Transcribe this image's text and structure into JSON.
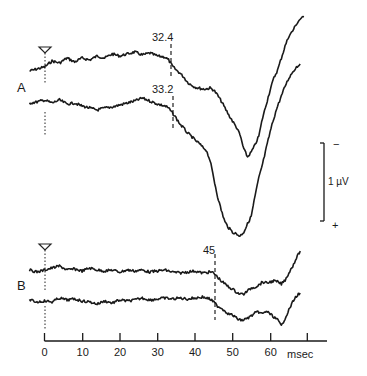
{
  "chart_data": {
    "type": "line",
    "title": "",
    "xlabel": "msec",
    "ylabel": "",
    "xlim": [
      0,
      68
    ],
    "x_ticks": [
      0,
      10,
      20,
      30,
      40,
      50,
      60
    ],
    "x_tick_labels": [
      "0",
      "10",
      "20",
      "30",
      "40",
      "50",
      "60"
    ],
    "scale_bar": {
      "label": "1 µV",
      "top_sign": "−",
      "bottom_sign": "+"
    },
    "stimulus_marker_ms": 0,
    "panels": [
      {
        "label": "A",
        "series": [
          {
            "name": "A upper trace",
            "onset_label": "32.4",
            "onset_ms": 32.4,
            "points": [
              [
                -4,
                71
              ],
              [
                -2,
                69
              ],
              [
                0,
                67
              ],
              [
                2,
                61
              ],
              [
                4,
                63
              ],
              [
                6,
                58
              ],
              [
                8,
                62
              ],
              [
                10,
                58
              ],
              [
                12,
                60
              ],
              [
                14,
                56
              ],
              [
                16,
                58
              ],
              [
                18,
                54
              ],
              [
                20,
                56
              ],
              [
                22,
                54
              ],
              [
                24,
                52
              ],
              [
                26,
                55
              ],
              [
                28,
                53
              ],
              [
                30,
                56
              ],
              [
                32,
                57
              ],
              [
                33,
                60
              ],
              [
                34,
                66
              ],
              [
                35,
                70
              ],
              [
                36,
                73
              ],
              [
                37,
                77
              ],
              [
                38,
                82
              ],
              [
                39,
                85
              ],
              [
                40,
                87
              ],
              [
                42,
                89
              ],
              [
                43,
                89
              ],
              [
                44,
                88
              ],
              [
                45,
                90
              ],
              [
                46,
                95
              ],
              [
                47,
                101
              ],
              [
                48,
                108
              ],
              [
                49,
                115
              ],
              [
                50,
                121
              ],
              [
                51,
                127
              ],
              [
                52,
                135
              ],
              [
                53,
                149
              ],
              [
                54,
                157
              ],
              [
                55,
                152
              ],
              [
                56,
                145
              ],
              [
                57,
                136
              ],
              [
                58,
                118
              ],
              [
                59,
                104
              ],
              [
                60,
                90
              ],
              [
                61,
                78
              ],
              [
                62,
                70
              ],
              [
                63,
                58
              ],
              [
                64,
                46
              ],
              [
                65,
                36
              ],
              [
                66,
                31
              ],
              [
                67,
                24
              ],
              [
                68,
                19
              ],
              [
                69,
                17
              ]
            ]
          },
          {
            "name": "A lower trace",
            "onset_label": "33.2",
            "onset_ms": 33.2,
            "points": [
              [
                -4,
                103
              ],
              [
                -2,
                102
              ],
              [
                0,
                100
              ],
              [
                2,
                103
              ],
              [
                4,
                100
              ],
              [
                6,
                104
              ],
              [
                8,
                103
              ],
              [
                10,
                106
              ],
              [
                12,
                108
              ],
              [
                14,
                110
              ],
              [
                16,
                108
              ],
              [
                18,
                107
              ],
              [
                20,
                105
              ],
              [
                22,
                103
              ],
              [
                24,
                101
              ],
              [
                26,
                98
              ],
              [
                28,
                101
              ],
              [
                30,
                104
              ],
              [
                32,
                106
              ],
              [
                33,
                108
              ],
              [
                34,
                113
              ],
              [
                35,
                118
              ],
              [
                36,
                124
              ],
              [
                37,
                128
              ],
              [
                38,
                133
              ],
              [
                39,
                136
              ],
              [
                40,
                140
              ],
              [
                41,
                143
              ],
              [
                42,
                147
              ],
              [
                43,
                150
              ],
              [
                44,
                160
              ],
              [
                45,
                178
              ],
              [
                46,
                196
              ],
              [
                47,
                210
              ],
              [
                48,
                222
              ],
              [
                49,
                228
              ],
              [
                50,
                232
              ],
              [
                51,
                234
              ],
              [
                52,
                236
              ],
              [
                53,
                232
              ],
              [
                54,
                224
              ],
              [
                55,
                216
              ],
              [
                56,
                196
              ],
              [
                57,
                178
              ],
              [
                58,
                164
              ],
              [
                59,
                148
              ],
              [
                60,
                132
              ],
              [
                61,
                118
              ],
              [
                62,
                106
              ],
              [
                63,
                96
              ],
              [
                64,
                86
              ],
              [
                65,
                78
              ],
              [
                66,
                72
              ],
              [
                67,
                67
              ],
              [
                68,
                64
              ]
            ]
          }
        ]
      },
      {
        "label": "B",
        "series": [
          {
            "name": "B upper trace",
            "onset_label": "45",
            "onset_ms": 45,
            "points": [
              [
                -4,
                270
              ],
              [
                -2,
                272
              ],
              [
                0,
                270
              ],
              [
                2,
                268
              ],
              [
                4,
                266
              ],
              [
                6,
                270
              ],
              [
                8,
                269
              ],
              [
                10,
                271
              ],
              [
                12,
                268
              ],
              [
                14,
                270
              ],
              [
                16,
                271
              ],
              [
                18,
                270
              ],
              [
                20,
                272
              ],
              [
                22,
                270
              ],
              [
                24,
                271
              ],
              [
                26,
                270
              ],
              [
                28,
                272
              ],
              [
                30,
                271
              ],
              [
                32,
                270
              ],
              [
                34,
                272
              ],
              [
                36,
                273
              ],
              [
                38,
                272
              ],
              [
                40,
                271
              ],
              [
                42,
                273
              ],
              [
                44,
                272
              ],
              [
                45,
                273
              ],
              [
                46,
                277
              ],
              [
                47,
                281
              ],
              [
                48,
                284
              ],
              [
                49,
                287
              ],
              [
                50,
                289
              ],
              [
                51,
                292
              ],
              [
                52,
                294
              ],
              [
                53,
                294
              ],
              [
                54,
                291
              ],
              [
                55,
                288
              ],
              [
                56,
                287
              ],
              [
                57,
                285
              ],
              [
                58,
                282
              ],
              [
                59,
                283
              ],
              [
                60,
                282
              ],
              [
                61,
                281
              ],
              [
                62,
                282
              ],
              [
                63,
                284
              ],
              [
                64,
                280
              ],
              [
                65,
                273
              ],
              [
                66,
                266
              ],
              [
                67,
                258
              ],
              [
                68,
                251
              ]
            ]
          },
          {
            "name": "B lower trace",
            "points": [
              [
                -4,
                300
              ],
              [
                -2,
                302
              ],
              [
                0,
                301
              ],
              [
                2,
                302
              ],
              [
                4,
                298
              ],
              [
                6,
                300
              ],
              [
                8,
                299
              ],
              [
                10,
                301
              ],
              [
                12,
                302
              ],
              [
                14,
                304
              ],
              [
                16,
                301
              ],
              [
                18,
                303
              ],
              [
                20,
                300
              ],
              [
                22,
                301
              ],
              [
                24,
                300
              ],
              [
                26,
                298
              ],
              [
                28,
                300
              ],
              [
                30,
                299
              ],
              [
                32,
                298
              ],
              [
                34,
                299
              ],
              [
                36,
                298
              ],
              [
                38,
                299
              ],
              [
                40,
                298
              ],
              [
                42,
                297
              ],
              [
                44,
                299
              ],
              [
                45,
                302
              ],
              [
                46,
                306
              ],
              [
                47,
                308
              ],
              [
                48,
                311
              ],
              [
                49,
                314
              ],
              [
                50,
                315
              ],
              [
                51,
                318
              ],
              [
                52,
                320
              ],
              [
                53,
                320
              ],
              [
                54,
                318
              ],
              [
                55,
                316
              ],
              [
                56,
                313
              ],
              [
                57,
                312
              ],
              [
                58,
                314
              ],
              [
                59,
                311
              ],
              [
                60,
                314
              ],
              [
                61,
                317
              ],
              [
                62,
                320
              ],
              [
                63,
                326
              ],
              [
                64,
                318
              ],
              [
                65,
                310
              ],
              [
                66,
                302
              ],
              [
                67,
                296
              ],
              [
                68,
                293
              ]
            ]
          }
        ]
      }
    ]
  },
  "labels": {
    "panel_a": "A",
    "panel_b": "B",
    "onset_a1": "32.4",
    "onset_a2": "33.2",
    "onset_b": "45",
    "scale": "1 µV",
    "scale_minus": "−",
    "scale_plus": "+",
    "x_unit": "msec",
    "ticks": [
      "0",
      "10",
      "20",
      "30",
      "40",
      "50",
      "60"
    ]
  }
}
